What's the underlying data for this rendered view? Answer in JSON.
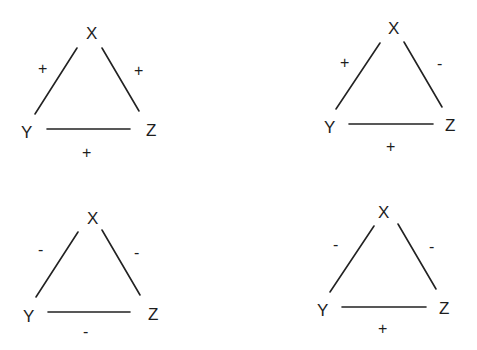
{
  "diagram": {
    "type": "balance-theory-triads",
    "triangles": [
      {
        "id": "top-left",
        "nodes": {
          "top": "X",
          "left": "Y",
          "right": "Z"
        },
        "edges": {
          "xy": "+",
          "xz": "+",
          "yz": "+"
        }
      },
      {
        "id": "top-right",
        "nodes": {
          "top": "X",
          "left": "Y",
          "right": "Z"
        },
        "edges": {
          "xy": "+",
          "xz": "-",
          "yz": "+"
        }
      },
      {
        "id": "bottom-left",
        "nodes": {
          "top": "X",
          "left": "Y",
          "right": "Z"
        },
        "edges": {
          "xy": "-",
          "xz": "-",
          "yz": "-"
        }
      },
      {
        "id": "bottom-right",
        "nodes": {
          "top": "X",
          "left": "Y",
          "right": "Z"
        },
        "edges": {
          "xy": "-",
          "xz": "-",
          "yz": "+"
        }
      }
    ]
  }
}
